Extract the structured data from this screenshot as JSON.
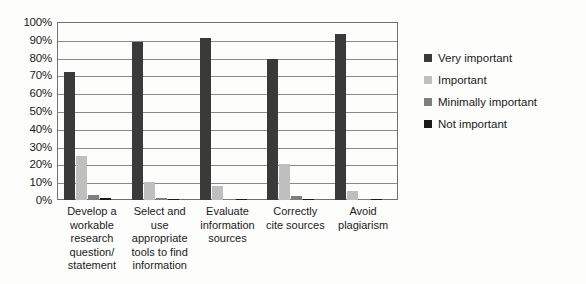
{
  "chart_data": {
    "type": "bar",
    "title": "",
    "subtitle": "",
    "xlabel": "",
    "ylabel": "",
    "ylim": [
      0,
      100
    ],
    "grid": true,
    "legend_position": "right",
    "categories": [
      "Develop a workable research question/ statement",
      "Select and use appropriate tools to find information",
      "Evaluate information sources",
      "Correctly cite sources",
      "Avoid plagiarism"
    ],
    "ytick_labels": [
      "100%",
      "90%",
      "80%",
      "70%",
      "60%",
      "50%",
      "40%",
      "30%",
      "20%",
      "10%",
      "0%"
    ],
    "ytick_values": [
      100,
      90,
      80,
      70,
      60,
      50,
      40,
      30,
      20,
      10,
      0
    ],
    "series": [
      {
        "name": "Very important",
        "color": "#3a3a3a",
        "values": [
          72,
          89,
          91,
          79,
          93
        ]
      },
      {
        "name": "Important",
        "color": "#bfbfbf",
        "values": [
          25,
          10,
          8,
          20,
          5
        ]
      },
      {
        "name": "Minimally important",
        "color": "#7f7f7f",
        "values": [
          3,
          1,
          0.5,
          2,
          0.5
        ]
      },
      {
        "name": "Not important",
        "color": "#1a1a1a",
        "values": [
          1,
          0.5,
          0.3,
          0.5,
          0.3
        ]
      }
    ]
  }
}
